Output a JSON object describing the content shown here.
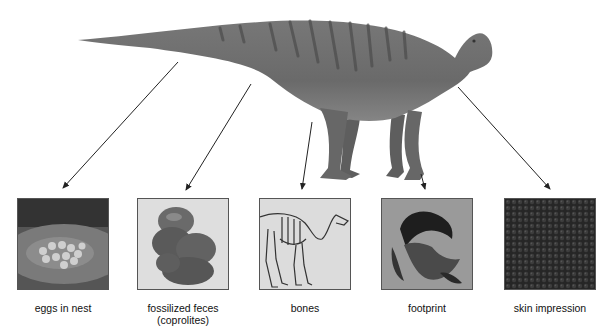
{
  "subject": {
    "name": "hadrosaur-dinosaur",
    "colors": {
      "body": "#6f6f6f",
      "stripes": "#4e4e4e",
      "belly": "#8a8a8a"
    }
  },
  "fossil_types": [
    {
      "id": "eggs",
      "label": "eggs in nest",
      "label_line2": ""
    },
    {
      "id": "feces",
      "label": "fossilized feces",
      "label_line2": "(coprolites)"
    },
    {
      "id": "bones",
      "label": "bones",
      "label_line2": ""
    },
    {
      "id": "footprint",
      "label": "footprint",
      "label_line2": ""
    },
    {
      "id": "skin",
      "label": "skin impression",
      "label_line2": ""
    }
  ],
  "arrow_color": "#222222"
}
